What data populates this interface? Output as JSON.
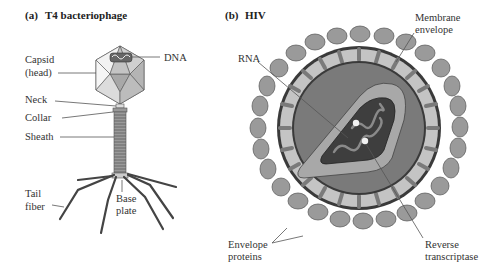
{
  "panels": {
    "a": {
      "letter": "(a)",
      "title": "T4 bacteriophage",
      "labels": {
        "capsid_1": "Capsid",
        "capsid_2": "(head)",
        "dna": "DNA",
        "neck": "Neck",
        "collar": "Collar",
        "sheath": "Sheath",
        "tail_1": "Tail",
        "tail_2": "fiber",
        "base_1": "Base",
        "base_2": "plate"
      }
    },
    "b": {
      "letter": "(b)",
      "title": "HIV",
      "labels": {
        "membrane_1": "Membrane",
        "membrane_2": "envelope",
        "rna": "RNA",
        "envelope_1": "Envelope",
        "envelope_2": "proteins",
        "rt_1": "Reverse",
        "rt_2": "transcriptase"
      }
    }
  },
  "colors": {
    "capsid_light": "#eeeeee",
    "capsid_mid": "#c8c8c8",
    "capsid_dark": "#9a9a9a",
    "fiber": "#444444",
    "protein": "#9a9a9a",
    "membrane": "#c4c4c4",
    "matrix": "#7a7a7a",
    "capsid_ring": "#a8a8a8",
    "core": "#3e3e3e",
    "rna": "#8a8a8a"
  }
}
